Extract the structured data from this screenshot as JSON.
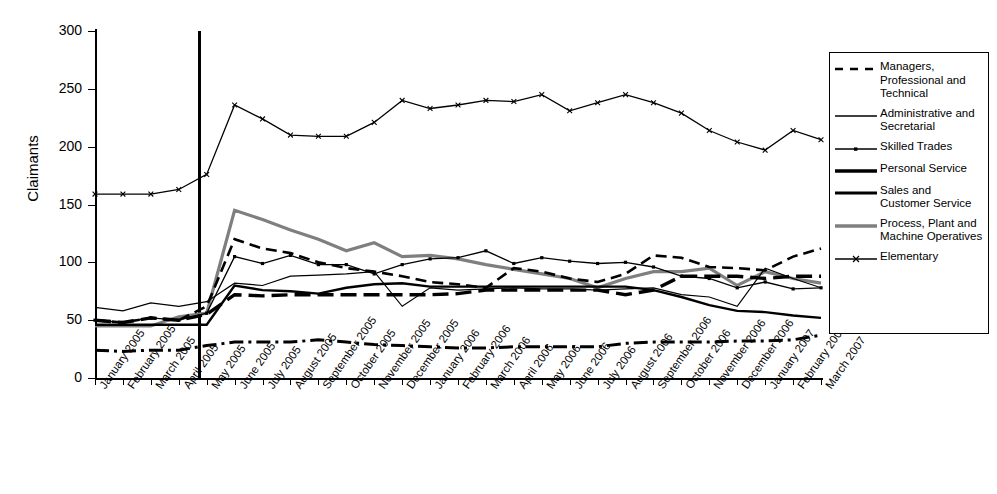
{
  "chart_data": {
    "type": "line",
    "title": "",
    "xlabel": "",
    "ylabel": "Claimants",
    "ylim": [
      0,
      300
    ],
    "yticks": [
      0,
      50,
      100,
      150,
      200,
      250,
      300
    ],
    "grid": false,
    "legend_position": "right",
    "annotations": [
      {
        "type": "vertical-line",
        "at": "May 2005",
        "label": ""
      }
    ],
    "categories": [
      "January 2005",
      "February 2005",
      "March 2005",
      "April 2005",
      "May 2005",
      "June 2005",
      "July 2005",
      "August 2005",
      "September 2005",
      "October 2005",
      "November 2005",
      "December 2005",
      "January 2006",
      "February 2006",
      "March 2006",
      "April 2006",
      "May 2006",
      "June 2006",
      "July 2006",
      "August 2006",
      "September 2006",
      "October 2006",
      "November 2006",
      "December 2006",
      "January 2007",
      "February 2007",
      "March 2007"
    ],
    "series": [
      {
        "name": "Managers, Professional and Technical",
        "style": "dashed",
        "color": "#000000",
        "width": 2.6,
        "marker": "none",
        "values": [
          50,
          48,
          52,
          50,
          62,
          120,
          112,
          108,
          100,
          95,
          92,
          88,
          83,
          81,
          78,
          95,
          92,
          86,
          83,
          90,
          106,
          104,
          96,
          95,
          93,
          105,
          112
        ]
      },
      {
        "name": "Administrative and Secretarial",
        "style": "solid",
        "color": "#000000",
        "width": 1.2,
        "marker": "none",
        "values": [
          61,
          58,
          65,
          62,
          66,
          82,
          80,
          88,
          89,
          90,
          92,
          62,
          78,
          76,
          77,
          78,
          77,
          77,
          76,
          77,
          78,
          72,
          70,
          62,
          95,
          86,
          78
        ]
      },
      {
        "name": "Skilled Trades",
        "style": "solid",
        "color": "#000000",
        "width": 1.3,
        "marker": "dot",
        "values": [
          50,
          48,
          52,
          50,
          56,
          105,
          99,
          106,
          98,
          98,
          90,
          98,
          103,
          104,
          110,
          99,
          104,
          101,
          99,
          100,
          96,
          88,
          86,
          78,
          83,
          77,
          78
        ]
      },
      {
        "name": "Personal Service",
        "style": "dashed-thick",
        "color": "#000000",
        "width": 3.4,
        "marker": "none",
        "values": [
          50,
          48,
          52,
          50,
          55,
          72,
          71,
          72,
          72,
          72,
          72,
          72,
          72,
          73,
          76,
          76,
          76,
          76,
          76,
          72,
          76,
          88,
          88,
          88,
          86,
          88,
          88
        ]
      },
      {
        "name": "Sales and Customer Service",
        "style": "solid-thick",
        "color": "#000000",
        "width": 2.4,
        "marker": "none",
        "values": [
          46,
          46,
          46,
          46,
          46,
          80,
          76,
          75,
          73,
          78,
          81,
          82,
          79,
          79,
          79,
          79,
          79,
          79,
          79,
          79,
          76,
          70,
          63,
          58,
          57,
          54,
          52
        ]
      },
      {
        "name": "Process, Plant and Machine Operatives",
        "style": "solid-thick",
        "color": "#7f7f7f",
        "width": 3.2,
        "marker": "none",
        "values": [
          45,
          45,
          45,
          53,
          56,
          145,
          137,
          128,
          120,
          110,
          117,
          105,
          106,
          103,
          98,
          94,
          90,
          86,
          78,
          86,
          92,
          92,
          95,
          80,
          92,
          86,
          82
        ]
      },
      {
        "name": "Elementary",
        "style": "solid",
        "color": "#000000",
        "width": 1.3,
        "marker": "x",
        "values": [
          159,
          159,
          159,
          163,
          176,
          236,
          224,
          210,
          209,
          209,
          221,
          240,
          233,
          236,
          240,
          239,
          245,
          231,
          238,
          245,
          238,
          229,
          214,
          204,
          197,
          214,
          206
        ]
      }
    ],
    "extra_series": [
      {
        "name": "lowest dash-dot band",
        "style": "dash-dot",
        "values": [
          24,
          23,
          24,
          24,
          28,
          31,
          31,
          31,
          33,
          31,
          29,
          28,
          27,
          26,
          26,
          27,
          27,
          27,
          27,
          30,
          31,
          31,
          31,
          32,
          32,
          33,
          37
        ]
      }
    ]
  },
  "legend": {
    "items": [
      {
        "label": "Managers, Professional and Technical",
        "key": "dashed-line-key"
      },
      {
        "label": "Administrative and Secretarial",
        "key": "solid-thin-line-key"
      },
      {
        "label": "Skilled Trades",
        "key": "solid-dot-line-key"
      },
      {
        "label": "Personal Service",
        "key": "dashed-thick-line-key"
      },
      {
        "label": "Sales and Customer Service",
        "key": "solid-thick-line-key"
      },
      {
        "label": "Process, Plant and Machine Operatives",
        "key": "solid-gray-line-key"
      },
      {
        "label": "Elementary",
        "key": "solid-x-line-key"
      }
    ]
  }
}
